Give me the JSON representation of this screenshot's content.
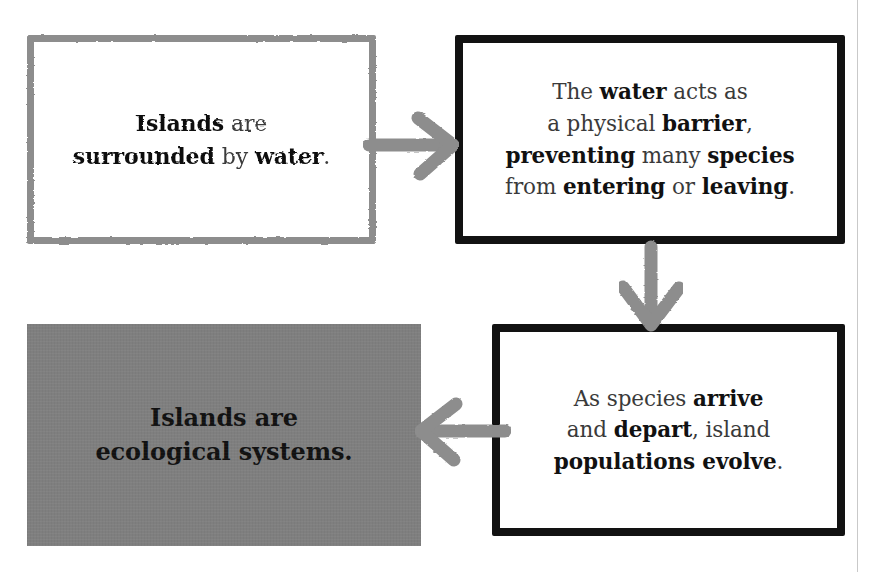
{
  "diagram": {
    "type": "flowchart",
    "title_visible": false,
    "background_color": "#ffffff",
    "palette": {
      "grey_stroke": "#8d8d8d",
      "black_stroke": "#121212",
      "grey_fill": "#7f7f7f",
      "arrow_grey": "#8d8d8d",
      "body_text": "#2b2b2b",
      "page_edge": "#c9c9c9"
    },
    "nodes": [
      {
        "id": "premise",
        "position": "top-left",
        "style": "grey-outline",
        "segments": [
          {
            "text": "Islands",
            "emphasis": "bold"
          },
          {
            "text": " are",
            "emphasis": "normal"
          },
          {
            "text": "\n",
            "emphasis": "break"
          },
          {
            "text": "surrounded",
            "emphasis": "bold"
          },
          {
            "text": " by ",
            "emphasis": "normal"
          },
          {
            "text": "water",
            "emphasis": "bold"
          },
          {
            "text": ".",
            "emphasis": "normal"
          }
        ],
        "plain_text": "Islands are surrounded by water."
      },
      {
        "id": "barrier",
        "position": "top-right",
        "style": "black-outline",
        "segments": [
          {
            "text": "The ",
            "emphasis": "normal"
          },
          {
            "text": "water",
            "emphasis": "bold"
          },
          {
            "text": " acts as",
            "emphasis": "normal"
          },
          {
            "text": "\n",
            "emphasis": "break"
          },
          {
            "text": "a physical ",
            "emphasis": "normal"
          },
          {
            "text": "barrier",
            "emphasis": "bold"
          },
          {
            "text": ",",
            "emphasis": "normal"
          },
          {
            "text": "\n",
            "emphasis": "break"
          },
          {
            "text": "preventing",
            "emphasis": "bold"
          },
          {
            "text": " many ",
            "emphasis": "normal"
          },
          {
            "text": "species",
            "emphasis": "bold"
          },
          {
            "text": "\n",
            "emphasis": "break"
          },
          {
            "text": "from ",
            "emphasis": "normal"
          },
          {
            "text": "entering",
            "emphasis": "bold"
          },
          {
            "text": " or ",
            "emphasis": "normal"
          },
          {
            "text": "leaving",
            "emphasis": "bold"
          },
          {
            "text": ".",
            "emphasis": "normal"
          }
        ],
        "plain_text": "The water acts as a physical barrier, preventing many species from entering or leaving."
      },
      {
        "id": "evolve",
        "position": "bottom-right",
        "style": "black-outline",
        "segments": [
          {
            "text": "As species ",
            "emphasis": "normal"
          },
          {
            "text": "arrive",
            "emphasis": "bold"
          },
          {
            "text": "\n",
            "emphasis": "break"
          },
          {
            "text": "and ",
            "emphasis": "normal"
          },
          {
            "text": "depart",
            "emphasis": "bold"
          },
          {
            "text": ", island",
            "emphasis": "normal"
          },
          {
            "text": "\n",
            "emphasis": "break"
          },
          {
            "text": "populations evolve",
            "emphasis": "bold"
          },
          {
            "text": ".",
            "emphasis": "normal"
          }
        ],
        "plain_text": "As species arrive and depart, island populations evolve."
      },
      {
        "id": "conclusion",
        "position": "bottom-left",
        "style": "grey-fill",
        "segments": [
          {
            "text": "Islands are",
            "emphasis": "bold"
          },
          {
            "text": "\n",
            "emphasis": "break"
          },
          {
            "text": "ecological systems.",
            "emphasis": "bold"
          }
        ],
        "plain_text": "Islands are ecological systems."
      }
    ],
    "arrows": [
      {
        "id": "premise-to-barrier",
        "from": "premise",
        "to": "barrier",
        "direction": "right",
        "color": "#8d8d8d"
      },
      {
        "id": "barrier-to-evolve",
        "from": "barrier",
        "to": "evolve",
        "direction": "down",
        "color": "#8d8d8d"
      },
      {
        "id": "evolve-to-conclusion",
        "from": "evolve",
        "to": "conclusion",
        "direction": "left",
        "color": "#8d8d8d"
      }
    ]
  }
}
